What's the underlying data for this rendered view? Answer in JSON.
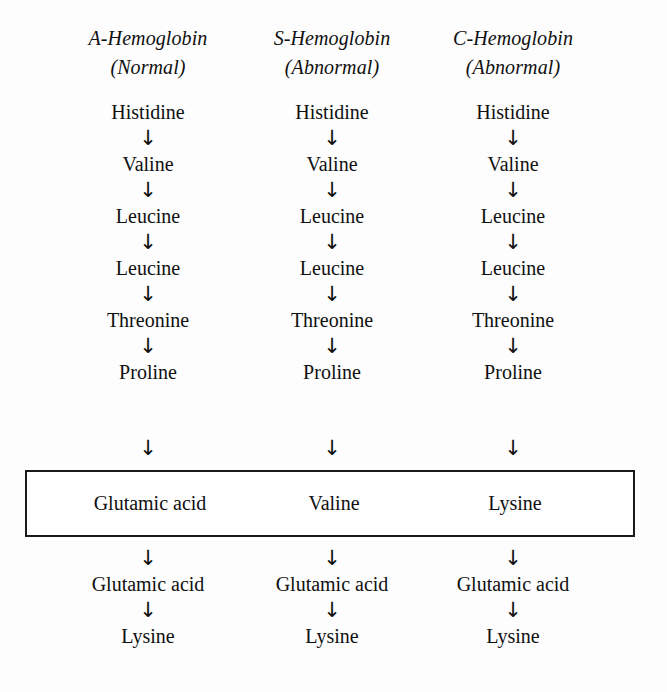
{
  "figure": {
    "background_color": "#fdfdfd",
    "text_color": "#101010",
    "box_border_color": "#1a1a1a",
    "arrow_glyph": "↓"
  },
  "columns": [
    {
      "id": "a-hemoglobin",
      "name": "A-Hemoglobin",
      "subtitle": "(Normal)",
      "center_x": 148,
      "top_sequence": [
        "Histidine",
        "Valine",
        "Leucine",
        "Leucine",
        "Threonine",
        "Proline"
      ],
      "variant_residue": "Glutamic acid",
      "bottom_sequence": [
        "Glutamic acid",
        "Lysine"
      ]
    },
    {
      "id": "s-hemoglobin",
      "name": "S-Hemoglobin",
      "subtitle": "(Abnormal)",
      "center_x": 332,
      "top_sequence": [
        "Histidine",
        "Valine",
        "Leucine",
        "Leucine",
        "Threonine",
        "Proline"
      ],
      "variant_residue": "Valine",
      "bottom_sequence": [
        "Glutamic acid",
        "Lysine"
      ]
    },
    {
      "id": "c-hemoglobin",
      "name": "C-Hemoglobin",
      "subtitle": "(Abnormal)",
      "center_x": 513,
      "top_sequence": [
        "Histidine",
        "Valine",
        "Leucine",
        "Leucine",
        "Threonine",
        "Proline"
      ],
      "variant_residue": "Lysine",
      "bottom_sequence": [
        "Glutamic acid",
        "Lysine"
      ]
    }
  ]
}
